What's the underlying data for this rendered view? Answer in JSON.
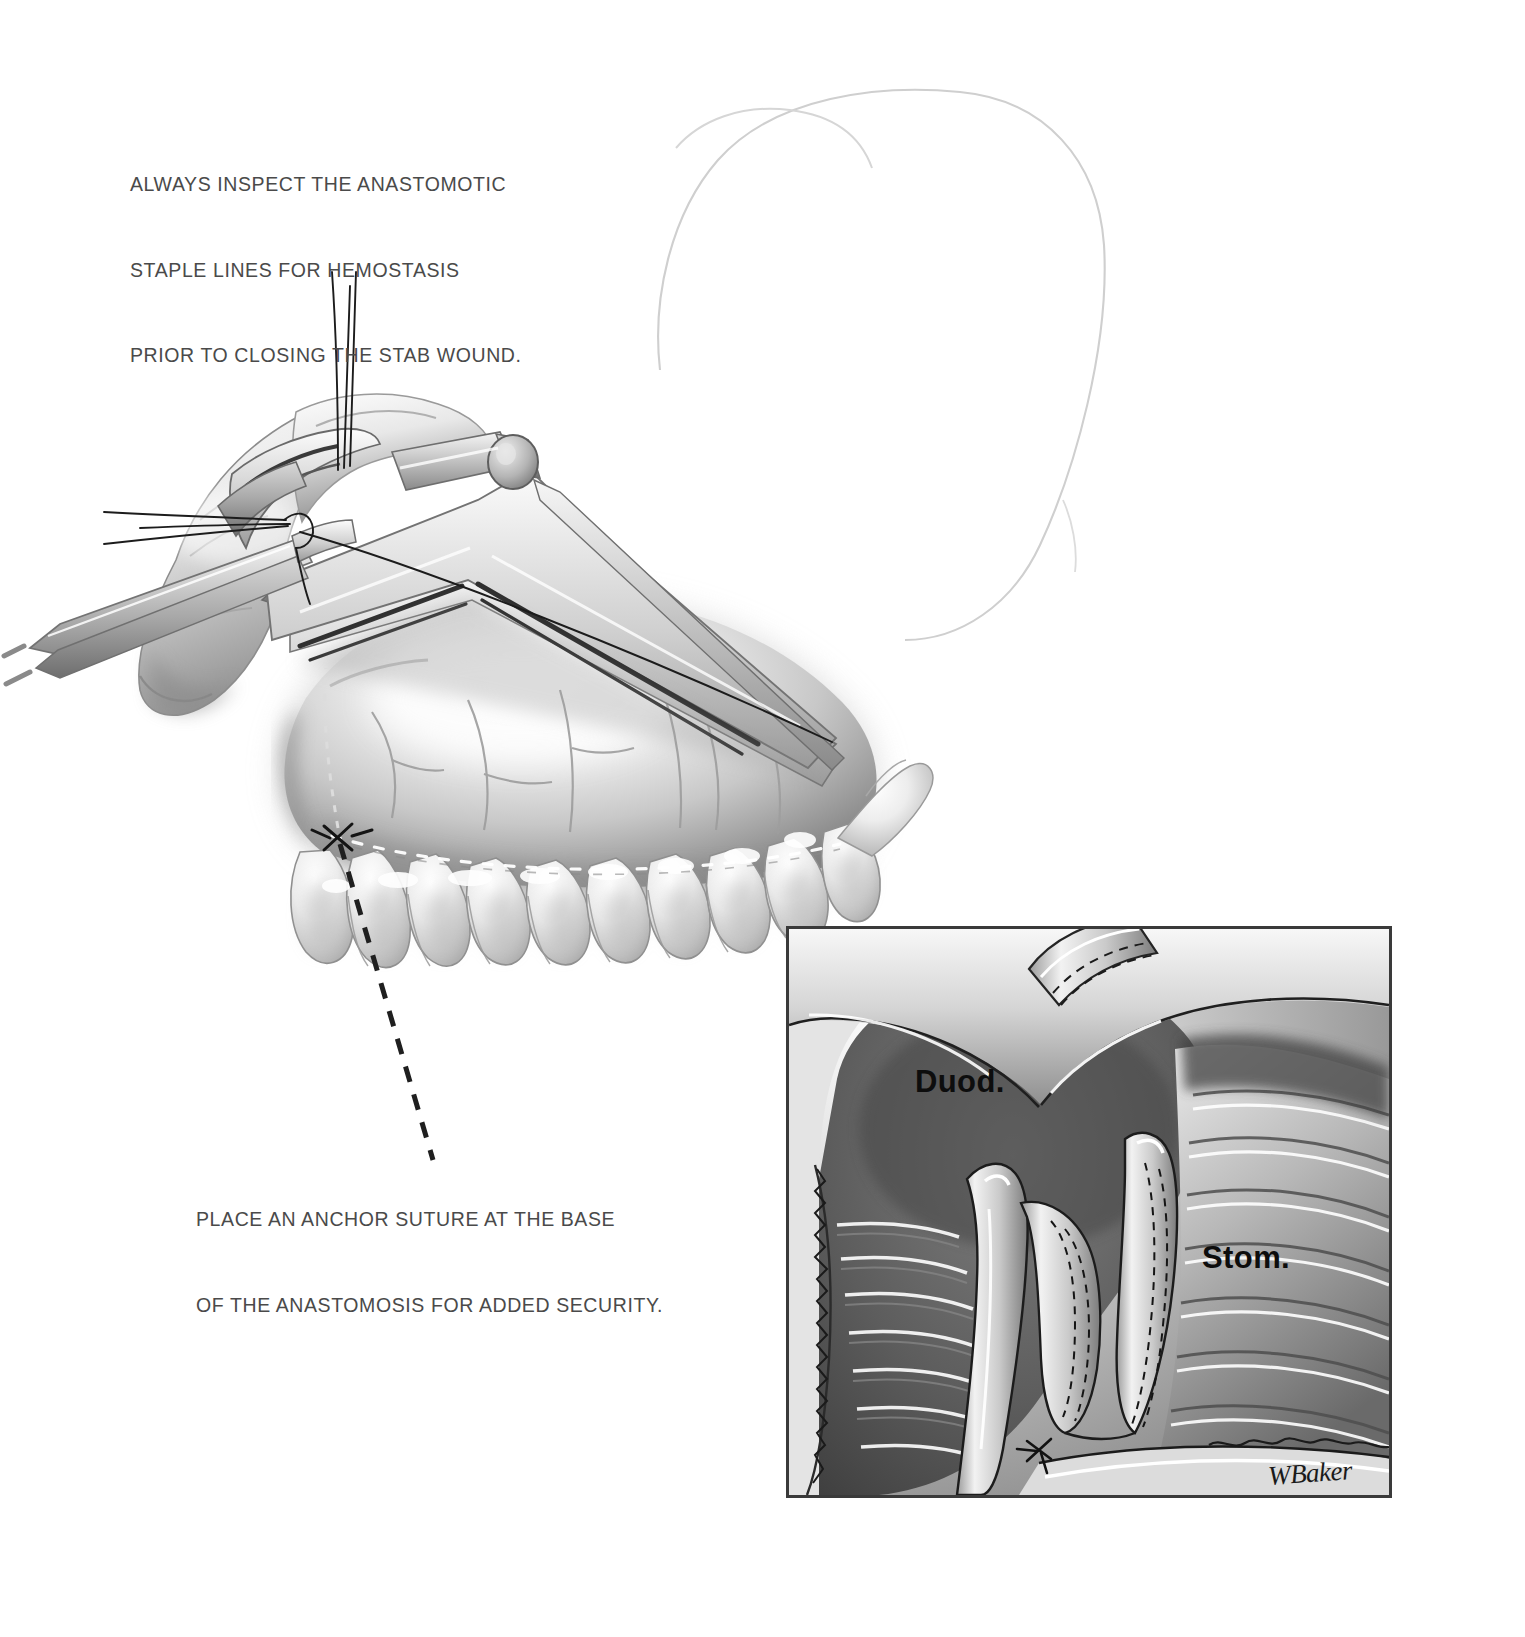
{
  "figure": {
    "background_color": "#ffffff",
    "ink_color": "#4a4a4a"
  },
  "captions": {
    "top": {
      "name": "hemostasis-instruction",
      "lines": [
        "ALWAYS INSPECT THE ANASTOMOTIC",
        "STAPLE LINES FOR HEMOSTASIS",
        "PRIOR TO CLOSING THE STAB WOUND."
      ]
    },
    "bottom": {
      "name": "anchor-suture-instruction",
      "lines": [
        "PLACE AN ANCHOR SUTURE AT THE BASE",
        "OF THE ANASTOMOSIS FOR ADDED SECURITY."
      ]
    }
  },
  "leader_line": {
    "style": "dashed",
    "color": "#1a1a1a",
    "from": "anchor-suture-site",
    "to": "bottom-caption"
  },
  "inset": {
    "name": "cutaway-detail-panel",
    "border_color": "#3a3a3a",
    "labels": [
      {
        "id": "duodenum",
        "text": "Duod."
      },
      {
        "id": "stomach",
        "text": "Stom."
      }
    ]
  },
  "signature": {
    "text": "WBaker",
    "color": "#1a1a1a"
  },
  "illustration": {
    "style": "grayscale-airbrush-medical-illustration",
    "elements": [
      "linear-stapler-device",
      "stapler-anvil-pin",
      "suture-threads",
      "forceps",
      "stomach-wall",
      "duodenum",
      "omental-fat-tabs",
      "staple-lines",
      "anchor-suture",
      "faint-liver-outline"
    ]
  }
}
